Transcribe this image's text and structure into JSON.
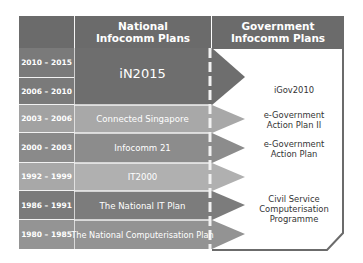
{
  "headers": {
    "national": "National\nInfocomm Plans",
    "national_line1": "National",
    "national_line2": "Infocomm Plans",
    "government_line1": "Government",
    "government_line2": "Infocomm Plans"
  },
  "years": [
    {
      "label": "2010 – 2015",
      "shade": "#7a7a7a"
    },
    {
      "label": "2006 – 2010",
      "shade": "#7a7a7a"
    },
    {
      "label": "2003 – 2006",
      "shade": "#a2a2a2"
    },
    {
      "label": "2000 – 2003",
      "shade": "#8a8a8a"
    },
    {
      "label": "1992 – 1999",
      "shade": "#a8a8a8"
    },
    {
      "label": "1986 – 1991",
      "shade": "#7a7a7a"
    },
    {
      "label": "1980 – 1985",
      "shade": "#949494"
    }
  ],
  "national_plans": [
    {
      "label": "iN2015",
      "shade": "#6e6e6e"
    },
    {
      "label": "Connected Singapore",
      "shade": "#a8a8a8"
    },
    {
      "label": "Infocomm 21",
      "shade": "#8c8c8c"
    },
    {
      "label": "IT2000",
      "shade": "#b0b0b0"
    },
    {
      "label": "The National IT Plan",
      "shade": "#7c7c7c"
    },
    {
      "label": "The National Computerisation Plan",
      "shade": "#939393"
    }
  ],
  "government_plans": [
    {
      "label": "iGov2010"
    },
    {
      "label_line1": "e-Government",
      "label_line2": "Action Plan II"
    },
    {
      "label_line1": "e-Government",
      "label_line2": "Action Plan"
    },
    {
      "label_line1": "Civil Service",
      "label_line2": "Computerisation",
      "label_line3": "Programme"
    }
  ],
  "colors": {
    "header": "#6b6b6b",
    "divider": "#f2f2f2",
    "panel_border": "#6b6b6b"
  }
}
